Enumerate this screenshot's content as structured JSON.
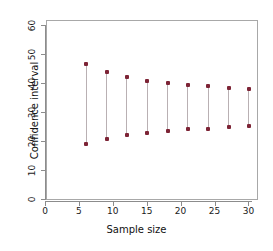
{
  "chart_data": {
    "type": "scatter",
    "title": "",
    "xlabel": "Sample size",
    "ylabel": "Confidence interval",
    "xlim": [
      0,
      31
    ],
    "ylim": [
      0,
      62
    ],
    "xticks": [
      0,
      5,
      10,
      15,
      20,
      25,
      30
    ],
    "xtick_labels": [
      "0",
      "5",
      "10",
      "15",
      "20",
      "25",
      "30"
    ],
    "yticks": [
      0,
      10,
      20,
      30,
      40,
      50,
      60
    ],
    "ytick_labels": [
      "0",
      "10",
      "20",
      "30",
      "40",
      "50",
      "60"
    ],
    "grid": false,
    "legend": null,
    "point_color": "#7d2436",
    "line_color": "#b9b0b3",
    "frame_color": "#a8a8a8",
    "categories": [
      6,
      9,
      12,
      15,
      18,
      21,
      24,
      27,
      30
    ],
    "series": [
      {
        "name": "Upper bound",
        "values": [
          46.5,
          43.8,
          42.0,
          40.7,
          39.9,
          39.4,
          38.8,
          38.4,
          38.0
        ]
      },
      {
        "name": "Lower bound",
        "values": [
          19.0,
          20.8,
          22.0,
          22.7,
          23.4,
          24.0,
          24.3,
          24.8,
          25.2
        ]
      }
    ],
    "intervals": [
      {
        "n": 6,
        "lower": 19.0,
        "upper": 46.5
      },
      {
        "n": 9,
        "lower": 20.8,
        "upper": 43.8
      },
      {
        "n": 12,
        "lower": 22.0,
        "upper": 42.0
      },
      {
        "n": 15,
        "lower": 22.7,
        "upper": 40.7
      },
      {
        "n": 18,
        "lower": 23.4,
        "upper": 39.9
      },
      {
        "n": 21,
        "lower": 24.0,
        "upper": 39.4
      },
      {
        "n": 24,
        "lower": 24.3,
        "upper": 38.8
      },
      {
        "n": 27,
        "lower": 24.8,
        "upper": 38.4
      },
      {
        "n": 30,
        "lower": 25.2,
        "upper": 38.0
      }
    ]
  }
}
